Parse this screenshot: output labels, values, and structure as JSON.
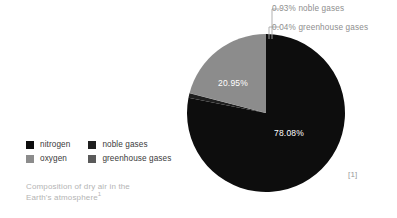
{
  "chart_data": {
    "type": "pie",
    "title": "Composition of dry air in the Earth's atmosphere",
    "start_angle_deg": 0,
    "direction": "clockwise",
    "legend_position": "left",
    "slices": [
      {
        "name": "nitrogen",
        "value": 78.08,
        "label": "78.08%",
        "color": "#0d0d0d",
        "label_inside": true,
        "label_color": "#ffffff"
      },
      {
        "name": "noble gases",
        "value": 0.93,
        "label": "0.93% noble gases",
        "color": "#1f1f1f",
        "label_inside": false,
        "label_color": "#8e8e8e"
      },
      {
        "name": "greenhouse gases",
        "value": 0.04,
        "label": "0.04% greenhouse gases",
        "color": "#2e2e2e",
        "label_inside": false,
        "label_color": "#8e8e8e"
      },
      {
        "name": "oxygen",
        "value": 20.95,
        "label": "20.95%",
        "color": "#8c8c8c",
        "label_inside": true,
        "label_color": "#ffffff"
      }
    ],
    "categories": [
      "nitrogen",
      "noble gases",
      "greenhouse gases",
      "oxygen"
    ],
    "values": [
      78.08,
      0.93,
      0.04,
      20.95
    ],
    "units": "percent"
  },
  "slice_labels": {
    "nitrogen": "78.08%",
    "oxygen": "20.95%"
  },
  "callouts": {
    "noble": "0.93% noble gases",
    "greenhouse": "0.04% greenhouse gases"
  },
  "legend": {
    "items": [
      {
        "label": "nitrogen",
        "color": "#0d0d0d"
      },
      {
        "label": "noble gases",
        "color": "#1f1f1f"
      },
      {
        "label": "oxygen",
        "color": "#8c8c8c"
      },
      {
        "label": "greenhouse gases",
        "color": "#5a5a5a"
      }
    ]
  },
  "caption": {
    "line1": "Composition of dry air in the",
    "line2": "Earth's atmosphere",
    "superscript": "1"
  },
  "citation": {
    "marker": "[1]"
  },
  "colors": {
    "background": "#ffffff",
    "nitrogen": "#0d0d0d",
    "oxygen": "#8c8c8c",
    "noble_gases": "#1f1f1f",
    "greenhouse_gases": "#2e2e2e",
    "caption_text": "#b4b4b4",
    "callout_text": "#8e8e8e",
    "legend_text": "#3a3a3a",
    "leader_line": "#a8a8a8"
  }
}
